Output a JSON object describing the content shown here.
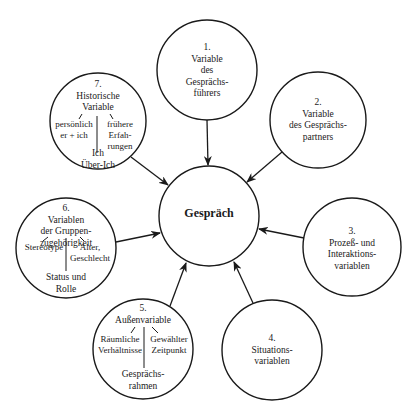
{
  "diagram": {
    "center": {
      "label": "Gespräch"
    },
    "nodes": [
      {
        "number": "1.",
        "lines": [
          "Variable",
          "des",
          "Gesprächs-",
          "führers"
        ]
      },
      {
        "number": "2.",
        "lines": [
          "Variable",
          "des Gesprächs-",
          "partners"
        ]
      },
      {
        "number": "3.",
        "lines": [
          "Prozeß- und",
          "Interaktions-",
          "variablen"
        ]
      },
      {
        "number": "4.",
        "lines": [
          "Situations-",
          "variablen"
        ]
      },
      {
        "number": "5.",
        "title": "Außenvariable",
        "left": [
          "Räumliche",
          "Verhältnisse"
        ],
        "right": [
          "Gewählter",
          "Zeitpunkt"
        ],
        "bottom": [
          "Gesprächs-",
          "rahmen"
        ]
      },
      {
        "number": "6.",
        "title_lines": [
          "Variablen",
          "der Gruppen-",
          "zugehörigkeit"
        ],
        "left": [
          "Stereotype"
        ],
        "right": [
          "Alter,",
          "Geschlecht"
        ],
        "bottom": [
          "Status und",
          "Rolle"
        ]
      },
      {
        "number": "7.",
        "title_lines": [
          "Historische",
          "Variable"
        ],
        "left": [
          "persönlich",
          "er + ich"
        ],
        "right": [
          "frühere",
          "Erfah-",
          "rungen"
        ],
        "bottom": [
          "Ich",
          "Über-Ich"
        ]
      }
    ],
    "colors": {
      "stroke": "#1a1a1a",
      "background": "#ffffff"
    }
  }
}
